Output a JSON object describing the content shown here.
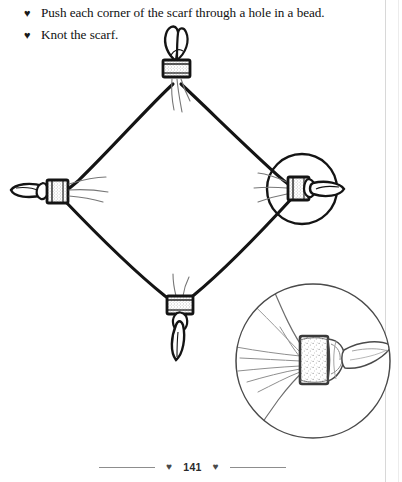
{
  "page": {
    "page_number": "141",
    "bullet_glyph": "♥",
    "footer_heart_glyph": "♥",
    "ink_color": "#111111",
    "paper_color": "#ffffff",
    "edge_line_color": "#d8d8d8"
  },
  "instructions": [
    {
      "bullet": "♥",
      "text": "Push each corner of the scarf through a hole in a bead."
    },
    {
      "bullet": "♥",
      "text": "Knot the scarf."
    }
  ],
  "illustration": {
    "title": "Square scarf with a bead knotted onto each of its four corners",
    "main_shape": "diamond",
    "vertices": [
      {
        "name": "top",
        "x": 176,
        "y": 80
      },
      {
        "name": "left",
        "x": 60,
        "y": 192
      },
      {
        "name": "bottom",
        "x": 180,
        "y": 301
      },
      {
        "name": "right",
        "x": 297,
        "y": 190
      }
    ],
    "beads": [
      {
        "name": "top-bead",
        "x": 176,
        "y": 70
      },
      {
        "name": "left-bead",
        "x": 52,
        "y": 192
      },
      {
        "name": "right-bead",
        "x": 300,
        "y": 188
      },
      {
        "name": "bottom-bead",
        "x": 180,
        "y": 307
      }
    ],
    "callout_circle_small": {
      "cx": 302,
      "cy": 189,
      "r": 35
    },
    "callout_circle_large": {
      "cx": 313,
      "cy": 361,
      "r": 77
    },
    "detail_view": {
      "label": "magnified corner knot",
      "bead_texture": "stippled"
    }
  },
  "footer": {
    "page_number": "141",
    "left_heart": "♥",
    "right_heart": "♥"
  }
}
